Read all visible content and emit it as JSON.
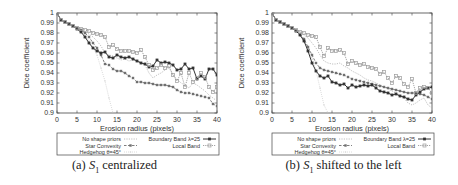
{
  "figures": [
    {
      "id": "a",
      "caption_prefix": "(a)",
      "caption_symbol": "S",
      "caption_subscript": "1",
      "caption_suffix": "centralized"
    },
    {
      "id": "b",
      "caption_prefix": "(b)",
      "caption_symbol": "S",
      "caption_subscript": "1",
      "caption_suffix": "shifted to the left"
    }
  ],
  "chart_data": [
    {
      "type": "line",
      "title": "(a) S1 centralized",
      "xlabel": "Erosion radius (pixels)",
      "ylabel": "Dice coefficient",
      "xlim": [
        0,
        40
      ],
      "ylim": [
        0.9,
        1.0
      ],
      "xticks": [
        0,
        5,
        10,
        15,
        20,
        25,
        30,
        35,
        40
      ],
      "yticks": [
        0.9,
        0.91,
        0.92,
        0.93,
        0.94,
        0.95,
        0.96,
        0.97,
        0.98,
        0.99,
        1
      ],
      "grid": false,
      "legend_position": "below",
      "series": [
        {
          "name": "No shape priors",
          "style": "dotted-light",
          "x": [
            0,
            1,
            2,
            3,
            4,
            5,
            6,
            7,
            8,
            9,
            10,
            11,
            12,
            13,
            14,
            15,
            16,
            17,
            18,
            19,
            20,
            21,
            22,
            23,
            24,
            25,
            26,
            27,
            28,
            29,
            30,
            31,
            32,
            33,
            34,
            35,
            36,
            37,
            38,
            39,
            40
          ],
          "values": [
            1.0,
            0.993,
            0.991,
            0.989,
            0.987,
            0.985,
            0.983,
            0.981,
            0.979,
            0.976,
            0.972,
            0.967,
            0.96,
            0.958,
            0.957,
            0.955,
            0.953,
            0.954,
            0.952,
            0.953,
            0.952,
            0.951,
            0.948,
            0.94,
            0.935,
            0.938,
            0.94,
            0.943,
            0.945,
            0.938,
            0.934,
            0.93,
            0.928,
            0.925,
            0.93,
            0.928,
            0.925,
            0.922,
            0.918,
            0.915,
            0.912
          ]
        },
        {
          "name": "Star Convexity",
          "style": "dashed-star",
          "x": [
            0,
            1,
            2,
            3,
            4,
            5,
            6,
            7,
            8,
            9,
            10,
            11,
            12,
            13,
            14,
            15,
            16,
            17,
            18,
            19,
            20,
            21,
            22,
            23,
            24,
            25,
            26,
            27,
            28,
            29,
            30,
            31,
            32,
            33,
            34,
            35,
            36,
            37,
            38,
            39,
            40
          ],
          "values": [
            1.0,
            0.993,
            0.991,
            0.989,
            0.987,
            0.985,
            0.983,
            0.98,
            0.976,
            0.97,
            0.965,
            0.958,
            0.949,
            0.948,
            0.944,
            0.942,
            0.942,
            0.94,
            0.937,
            0.935,
            0.931,
            0.931,
            0.93,
            0.93,
            0.929,
            0.928,
            0.928,
            0.928,
            0.927,
            0.926,
            0.923,
            0.921,
            0.92,
            0.92,
            0.919,
            0.918,
            0.917,
            0.916,
            0.915,
            0.909,
            0.907
          ]
        },
        {
          "name": "Hedgehog θ=45°",
          "style": "dotted-lightest",
          "x": [
            0,
            1,
            2,
            3,
            4,
            5,
            6,
            7,
            8,
            9,
            10,
            11,
            12,
            13,
            14
          ],
          "values": [
            1.0,
            0.993,
            0.991,
            0.989,
            0.987,
            0.985,
            0.982,
            0.978,
            0.972,
            0.965,
            0.958,
            0.945,
            0.932,
            0.915,
            0.9
          ]
        },
        {
          "name": "Boundary Band λ=25",
          "style": "solid-plus",
          "x": [
            0,
            1,
            2,
            3,
            4,
            5,
            6,
            7,
            8,
            9,
            10,
            11,
            12,
            13,
            14,
            15,
            16,
            17,
            18,
            19,
            20,
            21,
            22,
            23,
            24,
            25,
            26,
            27,
            28,
            29,
            30,
            31,
            32,
            33,
            34,
            35,
            36,
            37,
            38,
            39,
            40
          ],
          "values": [
            1.0,
            0.993,
            0.991,
            0.989,
            0.987,
            0.984,
            0.981,
            0.976,
            0.97,
            0.965,
            0.962,
            0.96,
            0.961,
            0.956,
            0.955,
            0.958,
            0.956,
            0.955,
            0.956,
            0.954,
            0.952,
            0.95,
            0.949,
            0.946,
            0.947,
            0.953,
            0.95,
            0.951,
            0.95,
            0.948,
            0.943,
            0.944,
            0.949,
            0.944,
            0.945,
            0.934,
            0.937,
            0.934,
            0.944,
            0.944,
            0.938
          ]
        },
        {
          "name": "Local Band",
          "style": "dotted-square",
          "x": [
            0,
            1,
            2,
            3,
            4,
            5,
            6,
            7,
            8,
            9,
            10,
            11,
            12,
            13,
            14,
            15,
            16,
            17,
            18,
            19,
            20,
            21,
            22,
            23,
            24,
            25,
            26,
            27,
            28,
            29,
            30,
            31,
            32,
            33,
            34,
            35,
            36,
            37,
            38,
            39,
            40
          ],
          "values": [
            1.0,
            0.993,
            0.991,
            0.989,
            0.987,
            0.985,
            0.984,
            0.983,
            0.982,
            0.98,
            0.979,
            0.978,
            0.976,
            0.966,
            0.968,
            0.964,
            0.962,
            0.962,
            0.962,
            0.961,
            0.96,
            0.963,
            0.956,
            0.948,
            0.943,
            0.945,
            0.948,
            0.945,
            0.947,
            0.938,
            0.932,
            0.94,
            0.926,
            0.94,
            0.931,
            0.935,
            0.94,
            0.936,
            0.926,
            0.921,
            0.926
          ]
        }
      ]
    },
    {
      "type": "line",
      "title": "(b) S1 shifted to the left",
      "xlabel": "Erosion radius (pixels)",
      "ylabel": "Dice coefficient",
      "xlim": [
        0,
        40
      ],
      "ylim": [
        0.9,
        1.0
      ],
      "xticks": [
        0,
        5,
        10,
        15,
        20,
        25,
        30,
        35,
        40
      ],
      "yticks": [
        0.9,
        0.91,
        0.92,
        0.93,
        0.94,
        0.95,
        0.96,
        0.97,
        0.98,
        0.99,
        1
      ],
      "grid": false,
      "legend_position": "below",
      "series": [
        {
          "name": "No shape priors",
          "style": "dotted-light",
          "x": [
            0,
            1,
            2,
            3,
            4,
            5,
            6,
            7,
            8,
            9,
            10,
            11,
            12,
            13,
            14,
            15,
            16,
            17,
            18,
            19,
            20,
            21,
            22,
            23,
            24,
            25,
            26,
            27,
            28,
            29,
            30,
            31,
            32,
            33,
            34,
            35,
            36,
            37,
            38,
            39,
            40
          ],
          "values": [
            1.0,
            0.993,
            0.991,
            0.989,
            0.987,
            0.985,
            0.983,
            0.981,
            0.978,
            0.975,
            0.97,
            0.965,
            0.958,
            0.952,
            0.95,
            0.949,
            0.949,
            0.95,
            0.947,
            0.945,
            0.942,
            0.94,
            0.938,
            0.935,
            0.933,
            0.932,
            0.93,
            0.928,
            0.926,
            0.924,
            0.922,
            0.92,
            0.918,
            0.915,
            0.91,
            0.908,
            0.91,
            0.913,
            0.915,
            0.908,
            0.905
          ]
        },
        {
          "name": "Star Convexity",
          "style": "dashed-star",
          "x": [
            0,
            1,
            2,
            3,
            4,
            5,
            6,
            7,
            8,
            9,
            10,
            11,
            12,
            13,
            14,
            15,
            16,
            17,
            18,
            19,
            20,
            21,
            22,
            23,
            24,
            25,
            26,
            27,
            28,
            29,
            30,
            31,
            32,
            33,
            34,
            35,
            36,
            37,
            38,
            39,
            40
          ],
          "values": [
            1.0,
            0.993,
            0.991,
            0.989,
            0.987,
            0.985,
            0.982,
            0.979,
            0.974,
            0.966,
            0.958,
            0.95,
            0.945,
            0.943,
            0.942,
            0.941,
            0.94,
            0.939,
            0.938,
            0.936,
            0.934,
            0.933,
            0.932,
            0.931,
            0.93,
            0.929,
            0.928,
            0.927,
            0.926,
            0.925,
            0.924,
            0.923,
            0.922,
            0.921,
            0.92,
            0.92,
            0.92,
            0.919,
            0.918,
            0.916,
            0.914
          ]
        },
        {
          "name": "Hedgehog θ=45°",
          "style": "dotted-lightest",
          "x": [
            0,
            1,
            2,
            3,
            4,
            5,
            6,
            7,
            8,
            9,
            10,
            11,
            12,
            13,
            14
          ],
          "values": [
            1.0,
            0.993,
            0.991,
            0.989,
            0.987,
            0.985,
            0.982,
            0.978,
            0.972,
            0.964,
            0.955,
            0.942,
            0.925,
            0.908,
            0.9
          ]
        },
        {
          "name": "Boundary Band λ=25",
          "style": "solid-plus",
          "x": [
            0,
            1,
            2,
            3,
            4,
            5,
            6,
            7,
            8,
            9,
            10,
            11,
            12,
            13,
            14,
            15,
            16,
            17,
            18,
            19,
            20,
            21,
            22,
            23,
            24,
            25,
            26,
            27,
            28,
            29,
            30,
            31,
            32,
            33,
            34,
            35,
            36,
            37,
            38,
            39,
            40
          ],
          "values": [
            1.0,
            0.993,
            0.991,
            0.989,
            0.987,
            0.985,
            0.982,
            0.978,
            0.972,
            0.962,
            0.95,
            0.942,
            0.937,
            0.935,
            0.937,
            0.931,
            0.93,
            0.928,
            0.929,
            0.925,
            0.928,
            0.926,
            0.927,
            0.928,
            0.927,
            0.928,
            0.925,
            0.922,
            0.921,
            0.92,
            0.918,
            0.919,
            0.917,
            0.916,
            0.914,
            0.913,
            0.918,
            0.921,
            0.924,
            0.925,
            0.926
          ]
        },
        {
          "name": "Local Band",
          "style": "dotted-square",
          "x": [
            0,
            1,
            2,
            3,
            4,
            5,
            6,
            7,
            8,
            9,
            10,
            11,
            12,
            13,
            14,
            15,
            16,
            17,
            18,
            19,
            20,
            21,
            22,
            23,
            24,
            25,
            26,
            27,
            28,
            29,
            30,
            31,
            32,
            33,
            34,
            35,
            36,
            37,
            38,
            39,
            40
          ],
          "values": [
            1.0,
            0.993,
            0.991,
            0.989,
            0.987,
            0.985,
            0.983,
            0.981,
            0.98,
            0.978,
            0.977,
            0.976,
            0.966,
            0.957,
            0.965,
            0.962,
            0.962,
            0.963,
            0.96,
            0.949,
            0.952,
            0.95,
            0.948,
            0.949,
            0.946,
            0.945,
            0.944,
            0.939,
            0.941,
            0.935,
            0.93,
            0.937,
            0.935,
            0.929,
            0.926,
            0.934,
            0.92,
            0.925,
            0.926,
            0.925,
            0.92
          ]
        }
      ]
    }
  ],
  "legend": {
    "left_column": [
      "No shape priors",
      "Star Convexity",
      "Hedgehog θ=45°"
    ],
    "right_column": [
      "Boundary Band λ=25",
      "Local Band"
    ]
  }
}
